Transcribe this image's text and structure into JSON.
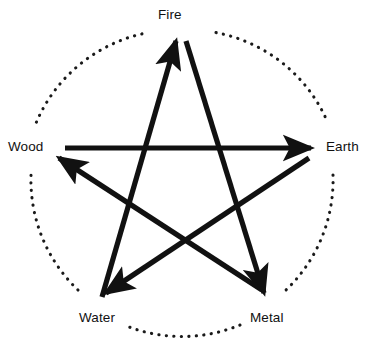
{
  "diagram": {
    "stroke_color": "#111111",
    "background_color": "#ffffff",
    "dotted_circle_color": "#1a1a1a",
    "nodes": [
      {
        "id": "fire",
        "label": "Fire",
        "x": 180,
        "y": 32
      },
      {
        "id": "earth",
        "label": "Earth",
        "x": 307,
        "y": 148
      },
      {
        "id": "metal",
        "label": "Metal",
        "x": 262,
        "y": 300
      },
      {
        "id": "water",
        "label": "Water",
        "x": 102,
        "y": 300
      },
      {
        "id": "wood",
        "label": "Wood",
        "x": 67,
        "y": 148
      }
    ],
    "edges": [
      {
        "id": "water-to-fire",
        "from": "water",
        "to": "fire",
        "arrow": true
      },
      {
        "id": "fire-to-metal",
        "from": "fire",
        "to": "metal",
        "arrow": true
      },
      {
        "id": "metal-to-wood",
        "from": "metal",
        "to": "wood",
        "arrow": true
      },
      {
        "id": "wood-to-earth",
        "from": "wood",
        "to": "earth",
        "arrow": true
      },
      {
        "id": "earth-to-water",
        "from": "earth",
        "to": "water",
        "arrow": true
      }
    ],
    "circle": {
      "cx": 182,
      "cy": 178,
      "r": 152,
      "style": "dotted"
    }
  }
}
